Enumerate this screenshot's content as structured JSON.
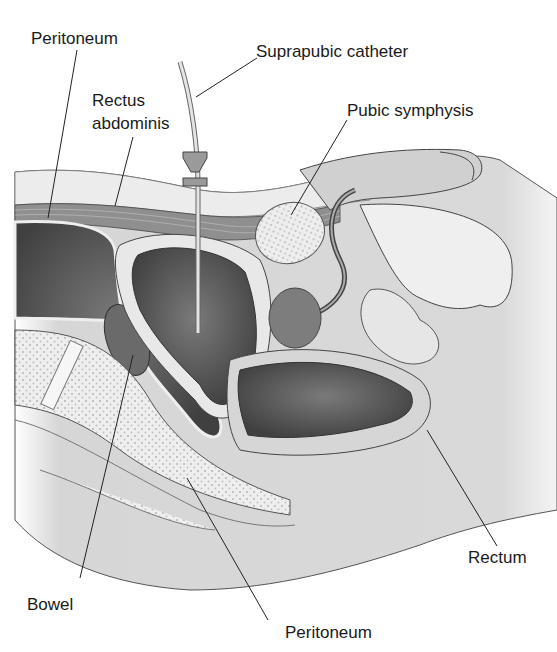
{
  "diagram": {
    "labels": {
      "peritoneum_top": "Peritoneum",
      "suprapubic_catheter": "Suprapubic catheter",
      "rectus_line1": "Rectus",
      "rectus_line2": "abdominis",
      "pubic_symphysis": "Pubic symphysis",
      "rectum": "Rectum",
      "bowel": "Bowel",
      "peritoneum_bottom": "Peritoneum"
    },
    "colors": {
      "background": "#ffffff",
      "tissue_light": "#d9d9d9",
      "tissue_mid": "#bdbdbd",
      "organ_dark": "#5a5a5a",
      "bone": "#ececec",
      "outline": "#333333"
    }
  }
}
